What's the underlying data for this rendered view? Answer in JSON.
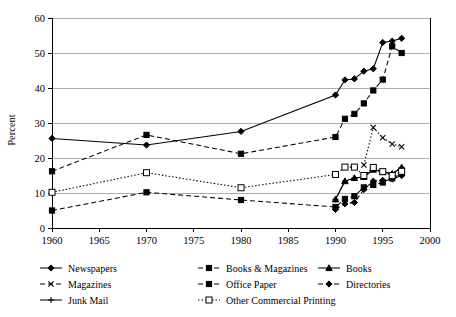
{
  "chart_data": {
    "type": "line",
    "title": "",
    "xlabel": "",
    "ylabel": "Percent",
    "xlim": [
      1960,
      2000
    ],
    "ylim": [
      0,
      60
    ],
    "xticks": [
      1960,
      1965,
      1970,
      1975,
      1980,
      1985,
      1990,
      1995,
      2000
    ],
    "yticks": [
      0,
      10,
      20,
      30,
      40,
      50,
      60
    ],
    "grid": "horizontal",
    "legend_position": "bottom",
    "series": [
      {
        "name": "Newspapers",
        "marker": "diamond-filled",
        "line_style": "solid",
        "x": [
          1960,
          1970,
          1980,
          1990,
          1991,
          1992,
          1993,
          1994,
          1995,
          1996,
          1997
        ],
        "y": [
          25.6,
          23.7,
          27.6,
          38.0,
          42.3,
          42.6,
          44.8,
          45.5,
          53.0,
          53.4,
          54.2
        ]
      },
      {
        "name": "Books & Magazines",
        "marker": "square-filled",
        "line_style": "dashed",
        "x": [
          1960,
          1970,
          1980,
          1990,
          1991,
          1992,
          1993,
          1994,
          1995,
          1996,
          1997
        ],
        "y": [
          16.2,
          26.6,
          21.2,
          26.0,
          31.2,
          32.6,
          35.6,
          39.3,
          42.4,
          51.9,
          50.0
        ]
      },
      {
        "name": "Books",
        "marker": "triangle-filled",
        "line_style": "solid",
        "x": [
          1990,
          1991,
          1992,
          1993,
          1994,
          1995,
          1996,
          1997
        ],
        "y": [
          8.2,
          13.4,
          14.3,
          14.6,
          16.7,
          16.0,
          15.5,
          17.3
        ]
      },
      {
        "name": "Magazines",
        "marker": "x",
        "line_style": "dotted",
        "x": [
          1993,
          1994,
          1995,
          1996,
          1997
        ],
        "y": [
          18.0,
          28.7,
          25.8,
          24.0,
          23.2
        ]
      },
      {
        "name": "Office Paper",
        "marker": "square-filled",
        "line_style": "dashed",
        "x": [
          1960,
          1970,
          1980,
          1990,
          1991,
          1992,
          1993,
          1994,
          1995,
          1996,
          1997
        ],
        "y": [
          5.0,
          10.2,
          8.0,
          6.0,
          8.3,
          9.1,
          11.6,
          12.3,
          13.0,
          14.2,
          15.6
        ]
      },
      {
        "name": "Directories",
        "marker": "diamond-filled",
        "line_style": "dashed",
        "x": [
          1990,
          1991,
          1992,
          1993,
          1994,
          1995,
          1996,
          1997
        ],
        "y": [
          5.3,
          6.9,
          7.3,
          11.0,
          13.4,
          13.6,
          14.0,
          15.0
        ]
      },
      {
        "name": "Junk Mail",
        "marker": "plus",
        "line_style": "solid",
        "x": [
          1990,
          1991,
          1992,
          1993,
          1994,
          1995,
          1996,
          1997
        ],
        "y": [
          8.2,
          13.4,
          14.3,
          14.6,
          16.7,
          16.0,
          15.5,
          17.3
        ]
      },
      {
        "name": "Other Commercial Printing",
        "marker": "square-open",
        "line_style": "dotted",
        "x": [
          1960,
          1970,
          1980,
          1990,
          1991,
          1992,
          1993,
          1994,
          1995,
          1996,
          1997
        ],
        "y": [
          10.2,
          15.8,
          11.5,
          15.3,
          17.4,
          17.4,
          15.0,
          17.3,
          16.1,
          15.0,
          16.2
        ]
      }
    ]
  },
  "axis": {
    "ylabel": "Percent",
    "ytick_labels": [
      "0",
      "10",
      "20",
      "30",
      "40",
      "50",
      "60"
    ],
    "xtick_labels": [
      "1960",
      "1965",
      "1970",
      "1975",
      "1980",
      "1985",
      "1990",
      "1995",
      "2000"
    ]
  },
  "legend": {
    "entries": [
      {
        "label": "Newspapers",
        "marker": "diamond-filled",
        "line_style": "solid"
      },
      {
        "label": "Books & Magazines",
        "marker": "square-filled",
        "line_style": "dashed"
      },
      {
        "label": "Books",
        "marker": "triangle-filled",
        "line_style": "solid"
      },
      {
        "label": "Magazines",
        "marker": "x",
        "line_style": "dashed"
      },
      {
        "label": "Office Paper",
        "marker": "square-filled",
        "line_style": "dashed"
      },
      {
        "label": "Directories",
        "marker": "diamond-filled",
        "line_style": "dashed"
      },
      {
        "label": "Junk Mail",
        "marker": "plus",
        "line_style": "solid"
      },
      {
        "label": "Other Commercial Printing",
        "marker": "square-open",
        "line_style": "dotted"
      }
    ]
  },
  "colors": {
    "line": "#000000",
    "grid": "#8a8a8a",
    "background": "#ffffff"
  }
}
